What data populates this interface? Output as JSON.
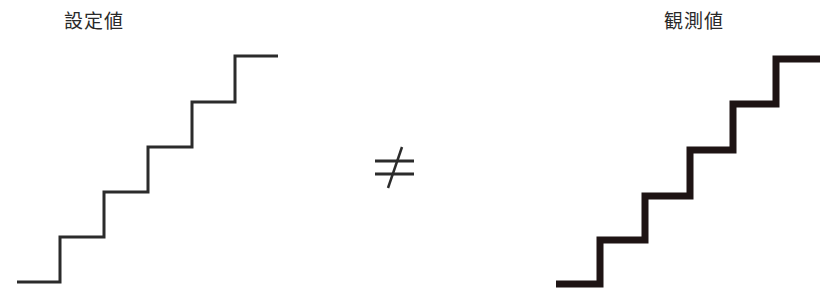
{
  "diagram": {
    "left_panel": {
      "label": "設定値",
      "stroke_color": "#2b2b2b",
      "stroke_width": 3,
      "steps": 6,
      "points": [
        [
          17,
          282
        ],
        [
          60,
          282
        ],
        [
          60,
          237
        ],
        [
          104,
          237
        ],
        [
          104,
          192
        ],
        [
          148,
          192
        ],
        [
          148,
          147
        ],
        [
          192,
          147
        ],
        [
          192,
          102
        ],
        [
          235,
          102
        ],
        [
          235,
          56
        ],
        [
          278,
          56
        ]
      ]
    },
    "relation": {
      "symbol": "≠",
      "meaning": "not-equal"
    },
    "right_panel": {
      "label": "観測値",
      "stroke_color": "#1e1414",
      "stroke_width": 7,
      "steps": 6,
      "points": [
        [
          556,
          284
        ],
        [
          600,
          284
        ],
        [
          600,
          240
        ],
        [
          645,
          240
        ],
        [
          645,
          196
        ],
        [
          690,
          196
        ],
        [
          690,
          150
        ],
        [
          733,
          150
        ],
        [
          733,
          104
        ],
        [
          776,
          104
        ],
        [
          776,
          59
        ],
        [
          820,
          59
        ]
      ]
    }
  }
}
